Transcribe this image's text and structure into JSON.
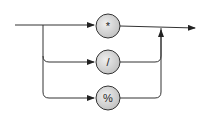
{
  "diagram": {
    "type": "syntax-diagram",
    "nodes": [
      {
        "id": "mul",
        "label": "*"
      },
      {
        "id": "div",
        "label": "/"
      },
      {
        "id": "mod",
        "label": "%"
      }
    ],
    "colors": {
      "node_fill": "#d6d6d6",
      "line": "#333333"
    }
  }
}
